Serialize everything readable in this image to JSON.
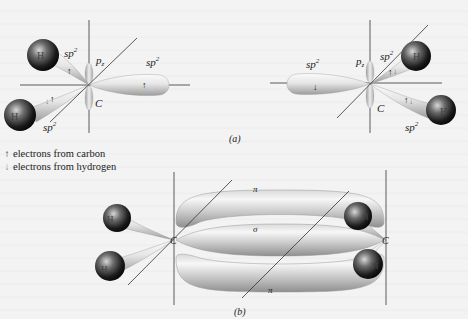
{
  "figure": {
    "panel_a": {
      "caption": "(a)",
      "left_carbon": {
        "atom_label": "C",
        "orbital_labels": {
          "sp2_top": "sp",
          "sp2_top_sup": "2",
          "sp2_bottom": "sp",
          "sp2_bottom_sup": "2",
          "sp2_right": "sp",
          "sp2_right_sup": "2",
          "pz": "p",
          "pz_sub": "z"
        },
        "hydrogens": [
          {
            "label": "H"
          },
          {
            "label": "H"
          }
        ]
      },
      "right_carbon": {
        "atom_label": "C",
        "orbital_labels": {
          "sp2_left": "sp",
          "sp2_left_sup": "2",
          "sp2_top": "sp",
          "sp2_top_sup": "2",
          "sp2_bottom": "sp",
          "sp2_bottom_sup": "2",
          "pz": "p",
          "pz_sub": "z"
        },
        "hydrogens": [
          {
            "label": "H"
          },
          {
            "label": "H"
          }
        ]
      }
    },
    "legend": {
      "items": [
        {
          "symbol": "↑",
          "label": "electrons from carbon"
        },
        {
          "symbol": "↓",
          "label": "electrons from hydrogen"
        }
      ]
    },
    "panel_b": {
      "caption": "(b)",
      "bond_labels": {
        "pi_top": "π",
        "sigma": "σ",
        "pi_bottom": "π"
      },
      "left_carbon": {
        "atom_label": "C",
        "hydrogens": [
          {
            "label": "H"
          },
          {
            "label": "H"
          }
        ]
      },
      "right_carbon": {
        "atom_label": "C",
        "hydrogens": [
          {
            "label": "H"
          },
          {
            "label": "H"
          }
        ]
      }
    },
    "colors": {
      "background": "#f3f3f3",
      "lobe_light": "#f4f4f4",
      "lobe_dark": "#a8a8a8",
      "atom_dark": "#111111",
      "atom_highlight": "#cfcfcf",
      "line": "#333333"
    }
  }
}
